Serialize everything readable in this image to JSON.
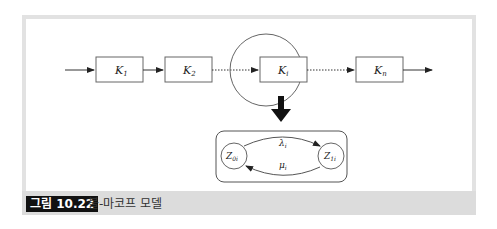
{
  "figure": {
    "caption_label": "그림 10.22",
    "caption_title": "불-마코프 모델"
  },
  "diagram": {
    "chain": [
      {
        "id": "k1",
        "label": "K",
        "sub": "1"
      },
      {
        "id": "k2",
        "label": "K",
        "sub": "2"
      },
      {
        "id": "ki",
        "label": "K",
        "sub": "i",
        "highlighted": true
      },
      {
        "id": "kn",
        "label": "K",
        "sub": "n"
      }
    ],
    "states": [
      {
        "id": "z0i",
        "label": "Z",
        "sub": "0i"
      },
      {
        "id": "z1i",
        "label": "Z",
        "sub": "1i"
      }
    ],
    "transitions": [
      {
        "from": "z0i",
        "to": "z1i",
        "label": "λ",
        "sub": "i"
      },
      {
        "from": "z1i",
        "to": "z0i",
        "label": "μ",
        "sub": "i"
      }
    ],
    "colors": {
      "stroke": "#555555",
      "frame": "#e2e2e2",
      "caption_bg": "#dcdcdc",
      "caption_label_bg": "#111111"
    }
  }
}
